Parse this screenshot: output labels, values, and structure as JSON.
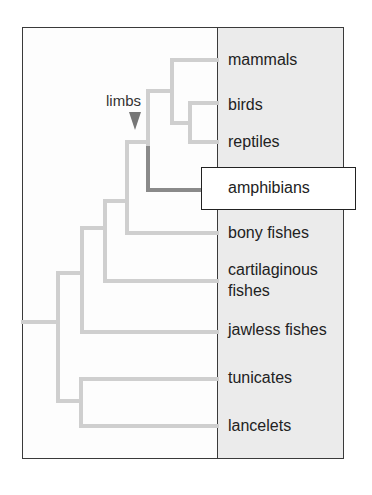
{
  "diagram": {
    "annotation": {
      "label": "limbs",
      "marker": "down-triangle",
      "color": "#777777"
    },
    "colors": {
      "branch": "#cfcfcf",
      "highlight_branch": "#8a8a8a",
      "panel": "#ebebeb",
      "border": "#3a3a3a"
    },
    "taxa": [
      {
        "id": "mammals",
        "label": "mammals"
      },
      {
        "id": "birds",
        "label": "birds"
      },
      {
        "id": "reptiles",
        "label": "reptiles"
      },
      {
        "id": "amphibians",
        "label": "amphibians",
        "highlighted": true
      },
      {
        "id": "bony-fishes",
        "label": "bony fishes"
      },
      {
        "id": "cartilaginous-fishes",
        "label_line1": "cartilaginous",
        "label_line2": "fishes"
      },
      {
        "id": "jawless-fishes",
        "label": "jawless fishes"
      },
      {
        "id": "tunicates",
        "label": "tunicates"
      },
      {
        "id": "lancelets",
        "label": "lancelets"
      }
    ]
  }
}
